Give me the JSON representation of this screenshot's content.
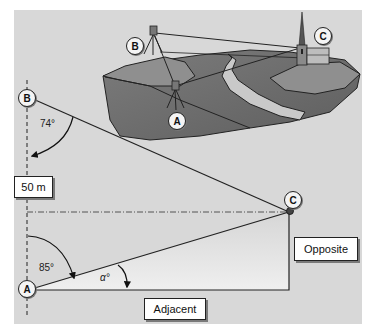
{
  "diagram": {
    "scene": {
      "stations": [
        {
          "id": "B",
          "label": "B",
          "description": "theodolite on tripod on hill"
        },
        {
          "id": "A",
          "label": "A",
          "description": "theodolite on tripod in valley"
        },
        {
          "id": "C",
          "label": "C",
          "description": "church with spire on far hill"
        }
      ],
      "features": [
        "river",
        "hills",
        "sight lines A-C, B-C, A-B"
      ]
    },
    "plan": {
      "points": {
        "A": "A",
        "B": "B",
        "C": "C"
      },
      "baseline_label": "50 m",
      "angle_at_B": "74°",
      "angle_at_A": "85°",
      "angle_alpha": "α°",
      "opposite_label": "Opposite",
      "adjacent_label": "Adjacent"
    },
    "colors": {
      "background": "#d8d8d8",
      "land_dark": "#6e6e6e",
      "land_mid": "#8c8c8c",
      "hilltop": "#9a9a9a",
      "river": "#c8c8c8",
      "triangle_fill": "#e6e6e6",
      "line": "#222222"
    }
  }
}
